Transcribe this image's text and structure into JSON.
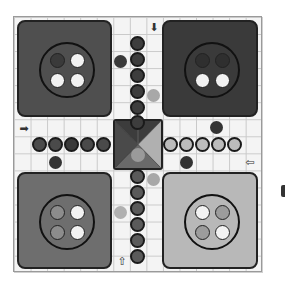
{
  "game": "Ludo",
  "colors": {
    "board_bg": "#f4f4f4",
    "grid_line": "#c9c9c9",
    "yard_top_left": "#4f4f4f",
    "yard_top_right": "#3a3a3a",
    "yard_bottom_left": "#6e6e6e",
    "yard_bottom_right": "#b8b8b8",
    "token_dark": "#3d3d3d",
    "token_mid": "#5a5a5a",
    "token_light": "#b9b9b9",
    "loose_dark": "#333333",
    "loose_light": "#a8a8a8"
  },
  "yards": [
    {
      "name": "top-left",
      "slots": [
        "filled",
        "empty",
        "empty",
        "empty"
      ]
    },
    {
      "name": "top-right",
      "slots": [
        "filled",
        "filled",
        "empty",
        "empty"
      ]
    },
    {
      "name": "bottom-left",
      "slots": [
        "filled",
        "empty",
        "filled",
        "empty"
      ]
    },
    {
      "name": "bottom-right",
      "slots": [
        "empty",
        "filled",
        "filled",
        "empty"
      ]
    }
  ],
  "home_paths": {
    "top": {
      "tokens": 6
    },
    "left": {
      "tokens": 5
    },
    "right": {
      "tokens": 5
    },
    "bottom": {
      "tokens": 6
    }
  },
  "start_arrows": [
    {
      "position": "top",
      "glyph": "⬇"
    },
    {
      "position": "left",
      "glyph": "➡"
    },
    {
      "position": "right",
      "glyph": "⇦"
    },
    {
      "position": "bottom",
      "glyph": "⇧"
    }
  ]
}
